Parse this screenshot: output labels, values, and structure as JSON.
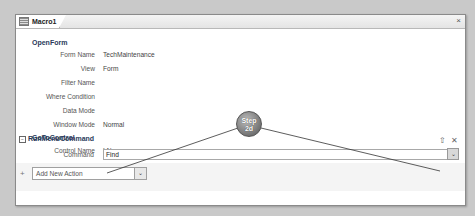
{
  "window": {
    "tab_label": "Macro1",
    "close_glyph": "×"
  },
  "actions": [
    {
      "name": "OpenForm",
      "args": [
        {
          "label": "Form Name",
          "value": "TechMaintenance"
        },
        {
          "label": "View",
          "value": "Form"
        },
        {
          "label": "Filter Name",
          "value": ""
        },
        {
          "label": "Where Condition",
          "value": ""
        },
        {
          "label": "Data Mode",
          "value": ""
        },
        {
          "label": "Window Mode",
          "value": "Normal"
        }
      ]
    },
    {
      "name": "GoToControl",
      "args": [
        {
          "label": "Control Name",
          "value": "LName"
        }
      ]
    },
    {
      "name": "RunMenuCommand",
      "collapse_glyph": "−",
      "args": [
        {
          "label": "Command",
          "value": "Find"
        }
      ]
    }
  ],
  "row_icons": {
    "move_up": "⇧",
    "delete": "✕"
  },
  "add_action": {
    "plus": "+",
    "placeholder": "Add New Action",
    "dropdown": "⌄"
  },
  "command_dropdown": "⌄",
  "callout": {
    "line1": "Step",
    "line2": "2d"
  }
}
